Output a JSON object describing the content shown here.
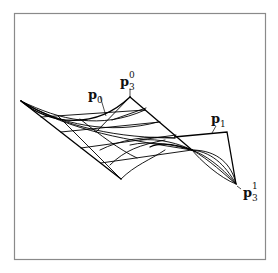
{
  "figure": {
    "labels": {
      "p0": {
        "base": "p",
        "sub": "0",
        "sup": ""
      },
      "p3_0": {
        "base": "p",
        "sub": "3",
        "sup": "0"
      },
      "p1": {
        "base": "p",
        "sub": "1",
        "sup": ""
      },
      "p3_1": {
        "base": "p",
        "sub": "3",
        "sup": "1"
      }
    },
    "colors": {
      "line": "#000000",
      "frame": "#8a8a8a",
      "background": "#ffffff"
    }
  }
}
